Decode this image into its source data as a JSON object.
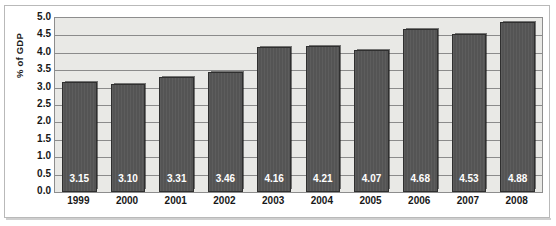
{
  "chart_data": {
    "type": "bar",
    "title": "",
    "xlabel": "",
    "ylabel": "% of GDP",
    "categories": [
      "1999",
      "2000",
      "2001",
      "2002",
      "2003",
      "2004",
      "2005",
      "2006",
      "2007",
      "2008"
    ],
    "values": [
      3.15,
      3.1,
      3.31,
      3.46,
      4.16,
      4.21,
      4.07,
      4.68,
      4.53,
      4.88
    ],
    "value_labels": [
      "3.15",
      "3.10",
      "3.31",
      "3.46",
      "4.16",
      "4.21",
      "4.07",
      "4.68",
      "4.53",
      "4.88"
    ],
    "ylim": [
      0.0,
      5.0
    ],
    "ytick_step": 0.5,
    "ytick_labels": [
      "5.0",
      "4.5",
      "4.0",
      "3.5",
      "3.0",
      "2.5",
      "2.0",
      "1.5",
      "1.0",
      "0.5",
      "0.0"
    ],
    "ytick_values": [
      5.0,
      4.5,
      4.0,
      3.5,
      3.0,
      2.5,
      2.0,
      1.5,
      1.0,
      0.5,
      0.0
    ],
    "grid": true,
    "grid_orientation": "horizontal",
    "legend": false,
    "legend_position": "none",
    "series": [
      {
        "name": "% of GDP",
        "values": [
          3.15,
          3.1,
          3.31,
          3.46,
          4.16,
          4.21,
          4.07,
          4.68,
          4.53,
          4.88
        ]
      }
    ],
    "colors": {
      "bar_fill": "#545454",
      "bar_outline": "#2f2f2f",
      "plot_background": "#e9e9e6",
      "gridline": "#8b8b8b",
      "axis_text": "#171717",
      "value_label_text": "#ffffff",
      "frame_border": "#b9b9b9",
      "page_background": "#ffffff"
    }
  }
}
